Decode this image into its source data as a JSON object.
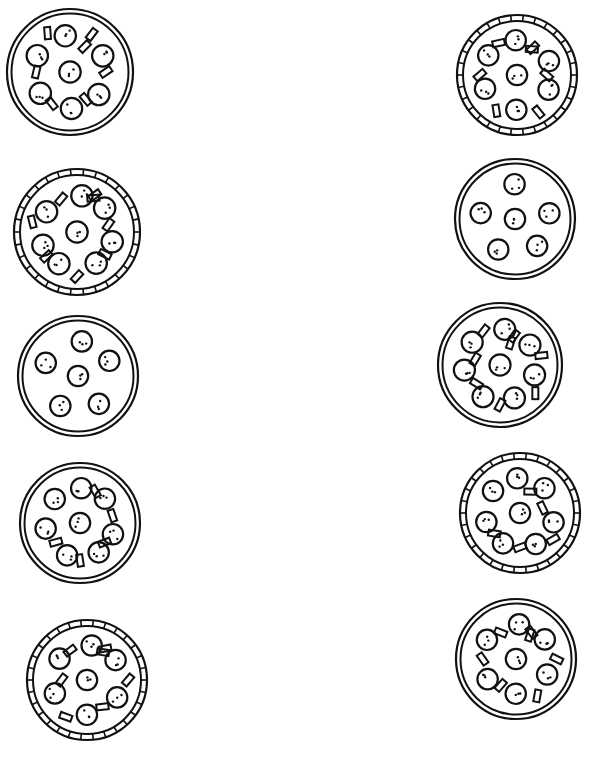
{
  "worksheet": {
    "kind": "pizza matching worksheet",
    "ink_color": "#111111",
    "paper_color": "#ffffff",
    "columns": {
      "left": [
        {
          "id": "L1",
          "cx": 70,
          "cy": 72,
          "r": 63,
          "crust": "plain",
          "pepperoni": 7,
          "peppers": 7
        },
        {
          "id": "L2",
          "cx": 77,
          "cy": 232,
          "r": 63,
          "crust": "crimped",
          "pepperoni": 8,
          "peppers": 8
        },
        {
          "id": "L3",
          "cx": 78,
          "cy": 376,
          "r": 60,
          "crust": "plain",
          "pepperoni": 6,
          "peppers": 0
        },
        {
          "id": "L4",
          "cx": 80,
          "cy": 523,
          "r": 60,
          "crust": "plain",
          "pepperoni": 8,
          "peppers": 5
        },
        {
          "id": "L5",
          "cx": 87,
          "cy": 680,
          "r": 60,
          "crust": "crimped",
          "pepperoni": 7,
          "peppers": 7
        }
      ],
      "right": [
        {
          "id": "R1",
          "cx": 517,
          "cy": 75,
          "r": 60,
          "crust": "crimped",
          "pepperoni": 7,
          "peppers": 7
        },
        {
          "id": "R2",
          "cx": 515,
          "cy": 219,
          "r": 60,
          "crust": "plain",
          "pepperoni": 6,
          "peppers": 0
        },
        {
          "id": "R3",
          "cx": 500,
          "cy": 365,
          "r": 62,
          "crust": "plain",
          "pepperoni": 8,
          "peppers": 8
        },
        {
          "id": "R4",
          "cx": 520,
          "cy": 513,
          "r": 60,
          "crust": "crimped",
          "pepperoni": 8,
          "peppers": 5
        },
        {
          "id": "R5",
          "cx": 516,
          "cy": 659,
          "r": 60,
          "crust": "plain",
          "pepperoni": 7,
          "peppers": 7
        }
      ]
    }
  }
}
